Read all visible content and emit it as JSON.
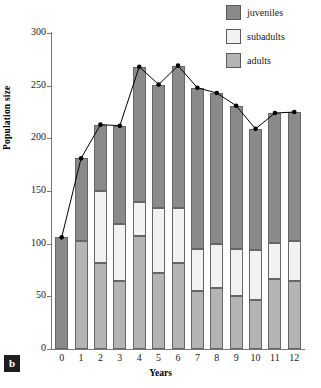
{
  "panel_label": "b",
  "legend": {
    "items": [
      {
        "label": "juveniles",
        "color": "#8a8a8a"
      },
      {
        "label": "subadults",
        "color": "#f2f2f2"
      },
      {
        "label": "adults",
        "color": "#b4b4b4"
      }
    ]
  },
  "axes": {
    "ylabel": "Population size",
    "xlabel": "Years",
    "yticks": [
      0,
      50,
      100,
      150,
      200,
      250,
      300
    ],
    "xticks": [
      0,
      1,
      2,
      3,
      4,
      5,
      6,
      7,
      8,
      9,
      10,
      11,
      12
    ]
  },
  "chart_data": {
    "type": "bar",
    "title": "",
    "xlabel": "Years",
    "ylabel": "Population size",
    "ylim": [
      0,
      300
    ],
    "xlim": [
      0,
      12
    ],
    "grid": false,
    "legend_position": "top-right",
    "stacked": true,
    "categories": [
      "0",
      "1",
      "2",
      "3",
      "4",
      "5",
      "6",
      "7",
      "8",
      "9",
      "10",
      "11",
      "12"
    ],
    "series": [
      {
        "name": "adults",
        "color": "#b4b4b4",
        "values": [
          0,
          103,
          82,
          65,
          107,
          72,
          82,
          55,
          58,
          50,
          47,
          66,
          65
        ]
      },
      {
        "name": "subadults",
        "color": "#f2f2f2",
        "values": [
          0,
          0,
          68,
          54,
          33,
          62,
          52,
          40,
          42,
          45,
          47,
          35,
          38
        ]
      },
      {
        "name": "juveniles",
        "color": "#8a8a8a",
        "values": [
          106,
          78,
          63,
          93,
          128,
          117,
          135,
          153,
          143,
          136,
          115,
          123,
          122
        ]
      }
    ],
    "overlay_line": {
      "name": "total population size",
      "marker": "filled-circle",
      "color": "#000000",
      "x": [
        0,
        1,
        2,
        3,
        4,
        5,
        6,
        7,
        8,
        9,
        10,
        11,
        12
      ],
      "values": [
        106,
        181,
        213,
        212,
        268,
        251,
        269,
        248,
        243,
        231,
        209,
        224,
        225
      ]
    }
  }
}
